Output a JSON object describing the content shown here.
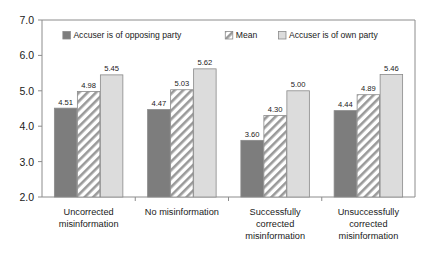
{
  "chart_data": {
    "type": "bar",
    "title": "",
    "xlabel": "",
    "ylabel": "",
    "ylim": [
      2.0,
      7.0
    ],
    "ytick_labels": [
      "2.0",
      "3.0",
      "4.0",
      "5.0",
      "6.0",
      "7.0"
    ],
    "yticks": [
      2.0,
      3.0,
      4.0,
      5.0,
      6.0,
      7.0
    ],
    "grid": false,
    "legend_position": "top-center",
    "categories": [
      "Uncorrected misinformation",
      "No misinformation",
      "Successfully corrected misinformation",
      "Unsuccessfully corrected misinformation"
    ],
    "category_lines": [
      [
        "Uncorrected",
        "misinformation"
      ],
      [
        "No misinformation"
      ],
      [
        "Successfully",
        "corrected",
        "misinformation"
      ],
      [
        "Unsuccessfully",
        "corrected",
        "misinformation"
      ]
    ],
    "series": [
      {
        "name": "Accuser is of opposing party",
        "values": [
          4.51,
          4.47,
          3.6,
          4.44
        ],
        "labels": [
          "4.51",
          "4.47",
          "3.60",
          "4.44"
        ],
        "fill": "#7d7d7d",
        "pattern": "solid"
      },
      {
        "name": "Mean",
        "values": [
          4.98,
          5.03,
          4.3,
          4.89
        ],
        "labels": [
          "4.98",
          "5.03",
          "4.30",
          "4.89"
        ],
        "fill": "#ffffff",
        "pattern": "diagonal-hatch"
      },
      {
        "name": "Accuser is of own party",
        "values": [
          5.45,
          5.62,
          5.0,
          5.46
        ],
        "labels": [
          "5.45",
          "5.62",
          "5.00",
          "5.46"
        ],
        "fill": "#dcdcdc",
        "pattern": "solid"
      }
    ]
  },
  "colors": {
    "series_1": "#7d7d7d",
    "series_2": "#ffffff",
    "series_3": "#dcdcdc",
    "axis": "#8c8c8c",
    "bar_stroke": "#8a8a8a",
    "text": "#1a1a1a",
    "background": "#ffffff"
  }
}
